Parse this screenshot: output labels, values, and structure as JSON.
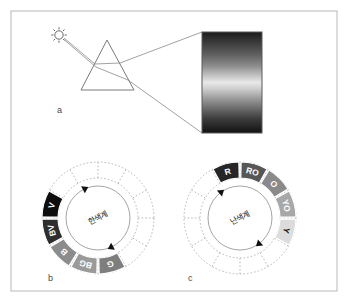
{
  "figure": {
    "background_color": "#ffffff",
    "frame": {
      "border_color": "#b8b8b8",
      "x": 11,
      "y": 11,
      "width": 326,
      "height": 280
    },
    "panels": [
      {
        "id": "a",
        "letter": "a",
        "label_x": 57,
        "label_y": 113
      },
      {
        "id": "b",
        "letter": "b",
        "label_x": 48,
        "label_y": 281
      },
      {
        "id": "c",
        "letter": "c",
        "label_x": 188,
        "label_y": 281
      }
    ]
  },
  "panel_a": {
    "name": "prism-dispersion-diagram",
    "sun": {
      "cx": 59,
      "cy": 35,
      "radius": 4.2,
      "ray_count": 8,
      "color": "#6b6b6b"
    },
    "prism": {
      "apex_x": 107,
      "apex_y": 40,
      "left_x": 81,
      "left_y": 90,
      "right_x": 134,
      "right_y": 90,
      "stroke": "#7a7a7a"
    },
    "rays": {
      "stroke": "#8a8a8a",
      "incident_from_x": 64,
      "incident_from_y": 38
    },
    "spectrum": {
      "x": 202,
      "y": 32,
      "width": 60,
      "height": 101,
      "border_color": "#5a5a5a",
      "description": "grayscale dispersed spectrum band, dark at top and bottom, bright in middle",
      "stops": [
        {
          "offset": 0,
          "color": "#1a1a1a"
        },
        {
          "offset": 0.1,
          "color": "#3a3a3a"
        },
        {
          "offset": 0.22,
          "color": "#5e5e5e"
        },
        {
          "offset": 0.34,
          "color": "#8e8e8e"
        },
        {
          "offset": 0.44,
          "color": "#c8c8c8"
        },
        {
          "offset": 0.5,
          "color": "#e8e8e8"
        },
        {
          "offset": 0.56,
          "color": "#cfcfcf"
        },
        {
          "offset": 0.66,
          "color": "#9a9a9a"
        },
        {
          "offset": 0.76,
          "color": "#6a6a6a"
        },
        {
          "offset": 0.86,
          "color": "#3c3c3c"
        },
        {
          "offset": 1,
          "color": "#121212"
        }
      ]
    }
  },
  "panel_b": {
    "name": "cool-color-wheel",
    "center_label": "한색계",
    "center": {
      "cx": 98,
      "cy": 218
    },
    "outer_radius": 56,
    "mid_radius": 40,
    "inner_radius": 27,
    "total_segments": 12,
    "dotted_color": "#b0b0b0",
    "arc_arrow_color": "#111111",
    "segments": [
      {
        "label": "V",
        "fill": "#0d0d0d",
        "text_color": "#ffffff",
        "index": 9
      },
      {
        "label": "BV",
        "fill": "#2e2e2e",
        "text_color": "#ffffff",
        "index": 8
      },
      {
        "label": "B",
        "fill": "#8c8c8c",
        "text_color": "#ffffff",
        "index": 7
      },
      {
        "label": "BG",
        "fill": "#9a9a9a",
        "text_color": "#ffffff",
        "index": 6
      },
      {
        "label": "G",
        "fill": "#7e7e7e",
        "text_color": "#ffffff",
        "index": 5
      }
    ]
  },
  "panel_c": {
    "name": "warm-color-wheel",
    "center_label": "난색계",
    "center": {
      "cx": 240,
      "cy": 218
    },
    "outer_radius": 56,
    "mid_radius": 40,
    "inner_radius": 27,
    "total_segments": 12,
    "dotted_color": "#b0b0b0",
    "arc_arrow_color": "#111111",
    "segments": [
      {
        "label": "R",
        "fill": "#262626",
        "text_color": "#ffffff",
        "index": 11
      },
      {
        "label": "RO",
        "fill": "#565656",
        "text_color": "#ffffff",
        "index": 0
      },
      {
        "label": "O",
        "fill": "#8a8a8a",
        "text_color": "#ffffff",
        "index": 1
      },
      {
        "label": "YO",
        "fill": "#a8a8a8",
        "text_color": "#ffffff",
        "index": 2
      },
      {
        "label": "Y",
        "fill": "#dcdcdc",
        "text_color": "#111111",
        "index": 3
      }
    ]
  }
}
